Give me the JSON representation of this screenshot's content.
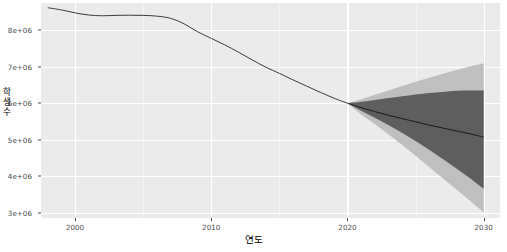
{
  "chart_data": {
    "type": "line",
    "title": "",
    "xlabel": "연도",
    "ylabel": "학생수",
    "xlim": [
      1997.5,
      2031.2
    ],
    "ylim": [
      2850000,
      8750000
    ],
    "grid": true,
    "legend": false,
    "x_ticks": [
      2000,
      2010,
      2020,
      2030
    ],
    "x_tick_labels": [
      "2000",
      "2010",
      "2020",
      "2030"
    ],
    "y_ticks": [
      3000000,
      4000000,
      5000000,
      6000000,
      7000000,
      8000000
    ],
    "y_tick_labels": [
      "3e+06",
      "4e+06",
      "5e+06",
      "6e+06",
      "7e+06",
      "8e+06"
    ],
    "series": [
      {
        "name": "historical",
        "style": "solid-line",
        "color": "#3C3C3C",
        "x": [
          1998,
          1999,
          2000,
          2001,
          2002,
          2003,
          2004,
          2005,
          2006,
          2007,
          2008,
          2009,
          2010,
          2011,
          2012,
          2013,
          2014,
          2015,
          2016,
          2017,
          2018,
          2019,
          2020
        ],
        "values": [
          8620000,
          8560000,
          8480000,
          8420000,
          8400000,
          8410000,
          8415000,
          8410000,
          8390000,
          8330000,
          8180000,
          7960000,
          7780000,
          7600000,
          7400000,
          7190000,
          6990000,
          6820000,
          6640000,
          6470000,
          6300000,
          6140000,
          6000000
        ]
      },
      {
        "name": "forecast-mean",
        "style": "solid-line",
        "color": "#1A1A1A",
        "x": [
          2020,
          2021,
          2022,
          2023,
          2024,
          2025,
          2026,
          2027,
          2028,
          2029,
          2030
        ],
        "values": [
          6000000,
          5880000,
          5770000,
          5670000,
          5580000,
          5490000,
          5400000,
          5320000,
          5240000,
          5160000,
          5070000
        ]
      }
    ],
    "bands": [
      {
        "name": "95% prediction interval",
        "color": "#BFBFBF",
        "opacity": 1,
        "x": [
          2020,
          2021,
          2022,
          2023,
          2024,
          2025,
          2026,
          2027,
          2028,
          2029,
          2030
        ],
        "lower": [
          6000000,
          5690000,
          5430000,
          5150000,
          4860000,
          4560000,
          4250000,
          3940000,
          3630000,
          3320000,
          3000000
        ],
        "upper": [
          6000000,
          6110000,
          6230000,
          6350000,
          6470000,
          6590000,
          6700000,
          6810000,
          6910000,
          7010000,
          7100000
        ]
      },
      {
        "name": "80% prediction interval",
        "color": "#5E5E5E",
        "opacity": 1,
        "x": [
          2020,
          2021,
          2022,
          2023,
          2024,
          2025,
          2026,
          2027,
          2028,
          2029,
          2030
        ],
        "lower": [
          6000000,
          5790000,
          5600000,
          5400000,
          5190000,
          4960000,
          4720000,
          4470000,
          4210000,
          3940000,
          3650000
        ],
        "upper": [
          6000000,
          6040000,
          6090000,
          6140000,
          6190000,
          6240000,
          6280000,
          6310000,
          6340000,
          6350000,
          6350000
        ]
      }
    ],
    "panel_background": "#EBEBEB",
    "gridline_color": "#FFFFFF",
    "axis_text_color": "#4D4D4D"
  },
  "axes": {
    "y_title_chars": [
      "학",
      "생",
      "수"
    ],
    "x_title": "연도"
  }
}
